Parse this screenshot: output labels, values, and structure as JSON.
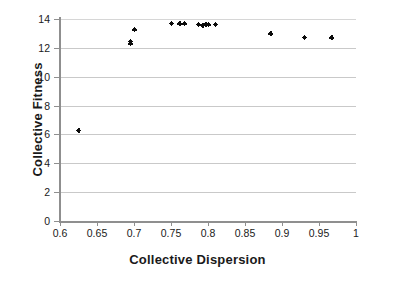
{
  "chart_data": {
    "type": "scatter",
    "title": "",
    "xlabel": "Collective Dispersion",
    "ylabel": "Collective Fitness",
    "xlim": [
      0.6,
      1.0
    ],
    "ylim": [
      0,
      14
    ],
    "grid": true,
    "legend": null,
    "xticks": [
      "0.6",
      "0.65",
      "0.7",
      "0.75",
      "0.8",
      "0.85",
      "0.9",
      "0.95",
      "1"
    ],
    "xtick_values": [
      0.6,
      0.65,
      0.7,
      0.75,
      0.8,
      0.85,
      0.9,
      0.95,
      1
    ],
    "yticks": [
      "0",
      "2",
      "4",
      "6",
      "8",
      "10",
      "12",
      "14"
    ],
    "ytick_values": [
      0,
      2,
      4,
      6,
      8,
      10,
      12,
      14
    ],
    "marker": "diamond-plus",
    "marker_color": "#0b0b0b",
    "series": [
      {
        "name": "Collective Fitness vs Collective Dispersion",
        "points": [
          {
            "x": 0.625,
            "y": 6.3
          },
          {
            "x": 0.695,
            "y": 12.3
          },
          {
            "x": 0.695,
            "y": 12.45
          },
          {
            "x": 0.7,
            "y": 13.25
          },
          {
            "x": 0.75,
            "y": 13.7
          },
          {
            "x": 0.762,
            "y": 13.68
          },
          {
            "x": 0.768,
            "y": 13.68
          },
          {
            "x": 0.787,
            "y": 13.65
          },
          {
            "x": 0.793,
            "y": 13.58
          },
          {
            "x": 0.797,
            "y": 13.6
          },
          {
            "x": 0.8,
            "y": 13.6
          },
          {
            "x": 0.81,
            "y": 13.65
          },
          {
            "x": 0.885,
            "y": 13.0
          },
          {
            "x": 0.93,
            "y": 12.75
          },
          {
            "x": 0.967,
            "y": 12.72
          }
        ]
      }
    ]
  }
}
